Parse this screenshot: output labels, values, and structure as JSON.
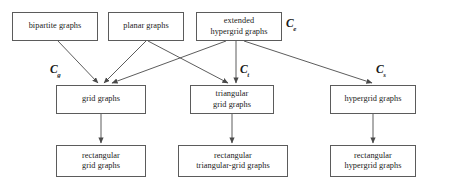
{
  "diagram": {
    "type": "hierarchy-flowchart",
    "stroke_color": "#5b5b5b",
    "arrow_color": "#4a4a4a",
    "text_color": "#1a1a1a",
    "background_color": "#ffffff",
    "nodes": [
      {
        "id": "bipartite",
        "label": "bipartite graphs",
        "row": 1,
        "x": 12,
        "y": 12,
        "w": 86,
        "h": 29
      },
      {
        "id": "planar",
        "label": "planar graphs",
        "row": 1,
        "x": 108,
        "y": 12,
        "w": 76,
        "h": 29
      },
      {
        "id": "extended_hypergrid",
        "label": "extended\nhypergrid graphs",
        "row": 1,
        "x": 196,
        "y": 12,
        "w": 86,
        "h": 29
      },
      {
        "id": "grid",
        "label": "grid graphs",
        "row": 2,
        "x": 56,
        "y": 85,
        "w": 90,
        "h": 29
      },
      {
        "id": "triangular_grid",
        "label": "triangular\ngrid graphs",
        "row": 2,
        "x": 190,
        "y": 85,
        "w": 84,
        "h": 29
      },
      {
        "id": "hypergrid",
        "label": "hypergrid graphs",
        "row": 2,
        "x": 330,
        "y": 85,
        "w": 86,
        "h": 29
      },
      {
        "id": "rect_grid",
        "label": "rectangular\ngrid graphs",
        "row": 3,
        "x": 56,
        "y": 145,
        "w": 90,
        "h": 32
      },
      {
        "id": "rect_triangular_grid",
        "label": "rectangular\ntriangular-grid graphs",
        "row": 3,
        "x": 178,
        "y": 145,
        "w": 110,
        "h": 32
      },
      {
        "id": "rect_hypergrid",
        "label": "rectangular\nhypergrid graphs",
        "row": 3,
        "x": 330,
        "y": 145,
        "w": 86,
        "h": 32
      }
    ],
    "class_labels": [
      {
        "id": "c_e",
        "letter": "C",
        "subscript": "e",
        "x": 286,
        "y": 18
      },
      {
        "id": "c_g",
        "letter": "C",
        "subscript": "g",
        "x": 50,
        "y": 64
      },
      {
        "id": "c_t",
        "letter": "C",
        "subscript": "t",
        "x": 240,
        "y": 64
      },
      {
        "id": "c_s",
        "letter": "C",
        "subscript": "s",
        "x": 376,
        "y": 64
      }
    ],
    "edges": [
      {
        "id": "bipartite-to-grid",
        "from": "bipartite",
        "to": "grid",
        "x1": 58,
        "y1": 41,
        "x2": 98,
        "y2": 83
      },
      {
        "id": "planar-to-grid",
        "from": "planar",
        "to": "grid",
        "x1": 146,
        "y1": 41,
        "x2": 104,
        "y2": 83
      },
      {
        "id": "planar-to-triangular-grid",
        "from": "planar",
        "to": "triangular_grid",
        "x1": 148,
        "y1": 41,
        "x2": 228,
        "y2": 83
      },
      {
        "id": "extended-to-grid",
        "from": "extended_hypergrid",
        "to": "grid",
        "x1": 226,
        "y1": 41,
        "x2": 112,
        "y2": 83
      },
      {
        "id": "extended-to-triangular-grid",
        "from": "extended_hypergrid",
        "to": "triangular_grid",
        "x1": 236,
        "y1": 41,
        "x2": 236,
        "y2": 83
      },
      {
        "id": "extended-to-hypergrid",
        "from": "extended_hypergrid",
        "to": "hypergrid",
        "x1": 244,
        "y1": 41,
        "x2": 372,
        "y2": 83
      },
      {
        "id": "grid-to-rect-grid",
        "from": "grid",
        "to": "rect_grid",
        "x1": 101,
        "y1": 114,
        "x2": 101,
        "y2": 143
      },
      {
        "id": "triangular-to-rect-triangular",
        "from": "triangular_grid",
        "to": "rect_triangular_grid",
        "x1": 232,
        "y1": 114,
        "x2": 232,
        "y2": 143
      },
      {
        "id": "hypergrid-to-rect-hypergrid",
        "from": "hypergrid",
        "to": "rect_hypergrid",
        "x1": 373,
        "y1": 114,
        "x2": 373,
        "y2": 143
      }
    ]
  }
}
